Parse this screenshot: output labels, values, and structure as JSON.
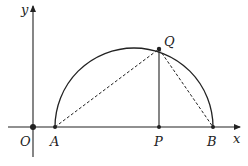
{
  "diagram": {
    "type": "geometry-semicircle",
    "axes": {
      "x_label": "x",
      "y_label": "y",
      "origin_label": "O"
    },
    "points": [
      {
        "id": "O",
        "label": "O"
      },
      {
        "id": "A",
        "label": "A"
      },
      {
        "id": "P",
        "label": "P"
      },
      {
        "id": "B",
        "label": "B"
      },
      {
        "id": "Q",
        "label": "Q"
      }
    ],
    "segments": [
      {
        "from": "A",
        "to": "Q",
        "style": "dashed"
      },
      {
        "from": "Q",
        "to": "B",
        "style": "dashed"
      },
      {
        "from": "Q",
        "to": "P",
        "style": "solid"
      }
    ],
    "arc": {
      "from": "A",
      "to": "B",
      "style": "solid",
      "shape": "semicircle"
    },
    "colors": {
      "stroke": "#222222",
      "background": "#ffffff"
    }
  }
}
